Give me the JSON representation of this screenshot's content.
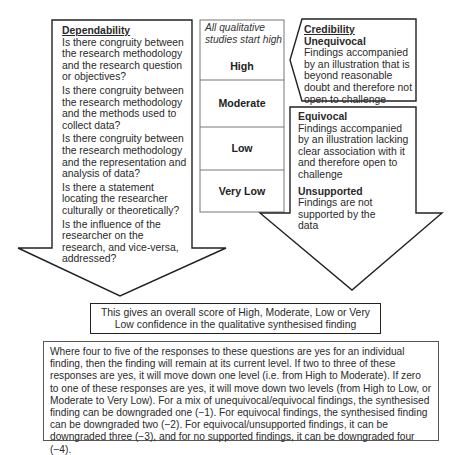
{
  "dependability": {
    "title": "Dependability",
    "questions": [
      "Is there congruity between the research methodology and the research question or objectives?",
      "Is there congruity between the research methodology and the methods used to collect data?",
      "Is there congruity between the research methodology and the representation and analysis of data?",
      "Is there a statement locating the researcher culturally or theoretically?",
      "Is the influence of the researcher on the research, and vice-versa, addressed?"
    ]
  },
  "levels": {
    "note": "All qualitative studies start high",
    "items": [
      "High",
      "Moderate",
      "Low",
      "Very Low"
    ]
  },
  "credibility": {
    "title": "Credibility",
    "unequivocal": {
      "label": "Unequivocal",
      "text": "Findings accompanied by an illustration that is beyond reasonable doubt and therefore not open to challenge"
    },
    "equivocal": {
      "label": "Equivocal",
      "text": "Findings accompanied by an illustration lacking clear association with it and therefore open to challenge"
    },
    "unsupported": {
      "label": "Unsupported",
      "text": "Findings are not supported by the data"
    }
  },
  "summary": {
    "text": "This gives an overall score of High, Moderate, Low or Very Low confidence in the qualitative synthesised finding"
  },
  "rules": {
    "text": "Where four to five of the responses to these questions are yes for an individual finding, then the finding will remain at its current level. If two to three of these responses are yes, it will move down one level (i.e. from High to Moderate). If zero to one of these responses are yes, it will move down two levels (from High to Low, or Moderate to Very Low). For a mix of unequivocal/equivocal findings, the synthesised finding can be downgraded one (−1). For equivocal findings, the synthesised finding can be downgraded two (−2). For equivocal/unsupported findings, it can be downgraded three (−3), and for no supported findings, it can be downgraded four (−4)."
  },
  "colors": {
    "stroke": "#222222",
    "level_border": "#777777",
    "text": "#2a2a2a"
  }
}
